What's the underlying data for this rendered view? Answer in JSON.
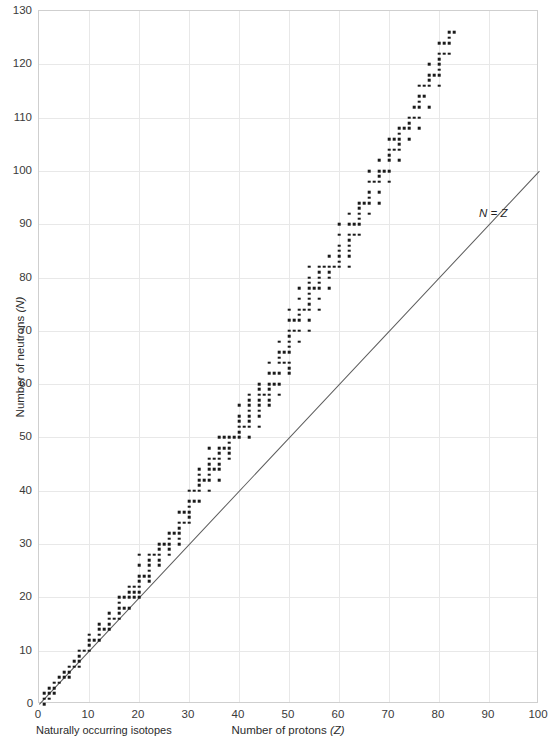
{
  "chart_data": {
    "type": "scatter",
    "title": "",
    "xlabel": "Number of protons (Z)",
    "ylabel": "Number of neutrons (N)",
    "xlim": [
      0,
      100
    ],
    "ylim": [
      0,
      130
    ],
    "xticks": [
      0,
      10,
      20,
      30,
      40,
      50,
      60,
      70,
      80,
      90,
      100
    ],
    "yticks": [
      0,
      10,
      20,
      30,
      40,
      50,
      60,
      70,
      80,
      90,
      100,
      110,
      120,
      130
    ],
    "grid": true,
    "legend": false,
    "annotations": [
      {
        "text": "N = Z",
        "x": 88,
        "y": 92,
        "style": "italic"
      }
    ],
    "reference_line": {
      "label": "N = Z",
      "from": [
        0,
        0
      ],
      "to": [
        100,
        100
      ],
      "color": "#5a5a5a"
    },
    "series": [
      {
        "name": "Naturally occurring isotopes",
        "marker": "square",
        "color": "#1a1a1a",
        "points": [
          [
            1,
            0
          ],
          [
            1,
            1
          ],
          [
            2,
            1
          ],
          [
            2,
            2
          ],
          [
            3,
            3
          ],
          [
            3,
            4
          ],
          [
            4,
            5
          ],
          [
            5,
            5
          ],
          [
            5,
            6
          ],
          [
            6,
            6
          ],
          [
            6,
            7
          ],
          [
            7,
            7
          ],
          [
            7,
            8
          ],
          [
            8,
            8
          ],
          [
            8,
            9
          ],
          [
            8,
            10
          ],
          [
            9,
            10
          ],
          [
            10,
            10
          ],
          [
            10,
            11
          ],
          [
            10,
            12
          ],
          [
            11,
            12
          ],
          [
            12,
            12
          ],
          [
            12,
            13
          ],
          [
            12,
            14
          ],
          [
            13,
            14
          ],
          [
            14,
            14
          ],
          [
            14,
            15
          ],
          [
            14,
            16
          ],
          [
            15,
            16
          ],
          [
            16,
            16
          ],
          [
            16,
            17
          ],
          [
            16,
            18
          ],
          [
            16,
            20
          ],
          [
            17,
            18
          ],
          [
            17,
            20
          ],
          [
            18,
            18
          ],
          [
            18,
            20
          ],
          [
            18,
            22
          ],
          [
            19,
            20
          ],
          [
            19,
            21
          ],
          [
            19,
            22
          ],
          [
            20,
            20
          ],
          [
            20,
            22
          ],
          [
            20,
            23
          ],
          [
            20,
            24
          ],
          [
            20,
            26
          ],
          [
            20,
            28
          ],
          [
            21,
            24
          ],
          [
            22,
            24
          ],
          [
            22,
            25
          ],
          [
            22,
            26
          ],
          [
            22,
            27
          ],
          [
            22,
            28
          ],
          [
            23,
            28
          ],
          [
            24,
            26
          ],
          [
            24,
            28
          ],
          [
            24,
            29
          ],
          [
            24,
            30
          ],
          [
            25,
            30
          ],
          [
            26,
            28
          ],
          [
            26,
            30
          ],
          [
            26,
            31
          ],
          [
            26,
            32
          ],
          [
            27,
            32
          ],
          [
            28,
            30
          ],
          [
            28,
            32
          ],
          [
            28,
            33
          ],
          [
            28,
            34
          ],
          [
            28,
            36
          ],
          [
            29,
            34
          ],
          [
            29,
            36
          ],
          [
            30,
            34
          ],
          [
            30,
            36
          ],
          [
            30,
            37
          ],
          [
            30,
            38
          ],
          [
            30,
            40
          ],
          [
            31,
            38
          ],
          [
            31,
            40
          ],
          [
            32,
            38
          ],
          [
            32,
            40
          ],
          [
            32,
            41
          ],
          [
            32,
            42
          ],
          [
            32,
            44
          ],
          [
            33,
            42
          ],
          [
            34,
            40
          ],
          [
            34,
            42
          ],
          [
            34,
            43
          ],
          [
            34,
            44
          ],
          [
            34,
            46
          ],
          [
            34,
            48
          ],
          [
            35,
            44
          ],
          [
            35,
            46
          ],
          [
            36,
            42
          ],
          [
            36,
            44
          ],
          [
            36,
            46
          ],
          [
            36,
            47
          ],
          [
            36,
            48
          ],
          [
            36,
            50
          ],
          [
            37,
            48
          ],
          [
            37,
            50
          ],
          [
            38,
            46
          ],
          [
            38,
            48
          ],
          [
            38,
            49
          ],
          [
            38,
            50
          ],
          [
            39,
            50
          ],
          [
            40,
            50
          ],
          [
            40,
            51
          ],
          [
            40,
            52
          ],
          [
            40,
            54
          ],
          [
            40,
            56
          ],
          [
            41,
            52
          ],
          [
            42,
            50
          ],
          [
            42,
            52
          ],
          [
            42,
            53
          ],
          [
            42,
            54
          ],
          [
            42,
            55
          ],
          [
            42,
            56
          ],
          [
            42,
            58
          ],
          [
            44,
            52
          ],
          [
            44,
            54
          ],
          [
            44,
            55
          ],
          [
            44,
            56
          ],
          [
            44,
            57
          ],
          [
            44,
            58
          ],
          [
            44,
            60
          ],
          [
            45,
            58
          ],
          [
            46,
            56
          ],
          [
            46,
            58
          ],
          [
            46,
            59
          ],
          [
            46,
            60
          ],
          [
            46,
            62
          ],
          [
            46,
            64
          ],
          [
            47,
            60
          ],
          [
            47,
            62
          ],
          [
            48,
            58
          ],
          [
            48,
            62
          ],
          [
            48,
            64
          ],
          [
            48,
            65
          ],
          [
            48,
            66
          ],
          [
            48,
            68
          ],
          [
            49,
            64
          ],
          [
            49,
            66
          ],
          [
            50,
            62
          ],
          [
            50,
            64
          ],
          [
            66,
            100
          ],
          [
            50,
            66
          ],
          [
            50,
            67
          ],
          [
            50,
            68
          ],
          [
            50,
            69
          ],
          [
            50,
            70
          ],
          [
            50,
            72
          ],
          [
            50,
            74
          ],
          [
            51,
            70
          ],
          [
            51,
            72
          ],
          [
            52,
            68
          ],
          [
            52,
            70
          ],
          [
            52,
            72
          ],
          [
            52,
            73
          ],
          [
            52,
            74
          ],
          [
            52,
            76
          ],
          [
            52,
            78
          ],
          [
            53,
            74
          ],
          [
            54,
            70
          ],
          [
            54,
            72
          ],
          [
            54,
            74
          ],
          [
            54,
            75
          ],
          [
            54,
            76
          ],
          [
            54,
            77
          ],
          [
            54,
            78
          ],
          [
            54,
            80
          ],
          [
            54,
            82
          ],
          [
            55,
            78
          ],
          [
            56,
            74
          ],
          [
            56,
            78
          ],
          [
            56,
            79
          ],
          [
            56,
            80
          ],
          [
            56,
            81
          ],
          [
            56,
            82
          ],
          [
            57,
            82
          ],
          [
            58,
            78
          ],
          [
            58,
            80
          ],
          [
            58,
            82
          ],
          [
            58,
            84
          ],
          [
            59,
            82
          ],
          [
            60,
            82
          ],
          [
            60,
            83
          ],
          [
            60,
            84
          ],
          [
            60,
            85
          ],
          [
            60,
            86
          ],
          [
            60,
            88
          ],
          [
            60,
            90
          ],
          [
            62,
            82
          ],
          [
            62,
            85
          ],
          [
            62,
            86
          ],
          [
            62,
            87
          ],
          [
            62,
            88
          ],
          [
            62,
            90
          ],
          [
            62,
            92
          ],
          [
            63,
            88
          ],
          [
            63,
            90
          ],
          [
            64,
            88
          ],
          [
            64,
            90
          ],
          [
            64,
            91
          ],
          [
            64,
            92
          ],
          [
            64,
            93
          ],
          [
            64,
            94
          ],
          [
            65,
            94
          ],
          [
            66,
            92
          ],
          [
            66,
            94
          ],
          [
            66,
            95
          ],
          [
            66,
            96
          ],
          [
            66,
            98
          ],
          [
            67,
            98
          ],
          [
            68,
            94
          ],
          [
            68,
            96
          ],
          [
            68,
            98
          ],
          [
            68,
            99
          ],
          [
            68,
            100
          ],
          [
            69,
            100
          ],
          [
            70,
            98
          ],
          [
            70,
            102
          ],
          [
            70,
            103
          ],
          [
            70,
            104
          ],
          [
            70,
            106
          ],
          [
            71,
            104
          ],
          [
            71,
            106
          ],
          [
            72,
            102
          ],
          [
            72,
            104
          ],
          [
            72,
            105
          ],
          [
            72,
            106
          ],
          [
            72,
            107
          ],
          [
            72,
            108
          ],
          [
            73,
            108
          ],
          [
            74,
            106
          ],
          [
            74,
            108
          ],
          [
            74,
            109
          ],
          [
            74,
            110
          ],
          [
            75,
            110
          ],
          [
            75,
            112
          ],
          [
            76,
            108
          ],
          [
            76,
            110
          ],
          [
            76,
            112
          ],
          [
            76,
            113
          ],
          [
            76,
            114
          ],
          [
            76,
            116
          ],
          [
            77,
            114
          ],
          [
            77,
            116
          ],
          [
            78,
            112
          ],
          [
            78,
            116
          ],
          [
            78,
            117
          ],
          [
            78,
            118
          ],
          [
            78,
            120
          ],
          [
            79,
            118
          ],
          [
            80,
            116
          ],
          [
            80,
            118
          ],
          [
            80,
            119
          ],
          [
            80,
            120
          ],
          [
            80,
            121
          ],
          [
            80,
            122
          ],
          [
            80,
            124
          ],
          [
            81,
            122
          ],
          [
            81,
            124
          ],
          [
            82,
            122
          ],
          [
            82,
            124
          ],
          [
            82,
            125
          ],
          [
            82,
            126
          ],
          [
            83,
            126
          ],
          [
            70,
            100
          ],
          [
            68,
            102
          ],
          [
            62,
            84
          ],
          [
            58,
            81
          ],
          [
            56,
            76
          ],
          [
            54,
            79
          ],
          [
            50,
            63
          ],
          [
            48,
            60
          ],
          [
            46,
            57
          ],
          [
            44,
            59
          ],
          [
            42,
            57
          ],
          [
            40,
            53
          ],
          [
            38,
            47
          ],
          [
            36,
            45
          ],
          [
            34,
            45
          ],
          [
            32,
            43
          ],
          [
            30,
            35
          ],
          [
            28,
            31
          ],
          [
            26,
            29
          ],
          [
            24,
            27
          ],
          [
            22,
            23
          ],
          [
            20,
            21
          ],
          [
            18,
            21
          ],
          [
            16,
            19
          ],
          [
            14,
            17
          ],
          [
            12,
            15
          ],
          [
            10,
            13
          ],
          [
            8,
            7
          ],
          [
            6,
            5
          ],
          [
            4,
            4
          ],
          [
            3,
            2
          ],
          [
            2,
            3
          ],
          [
            1,
            2
          ]
        ]
      }
    ]
  },
  "axes": {
    "x_title": "Number of protons (Z)",
    "x_title_main": "Number of protons",
    "x_title_symbol": "(Z)",
    "y_title_main": "Number of neutrons",
    "y_title_symbol": "(N)"
  },
  "caption": {
    "text": "Naturally occurring isotopes"
  },
  "annotation": {
    "nz_label": "N = Z"
  }
}
